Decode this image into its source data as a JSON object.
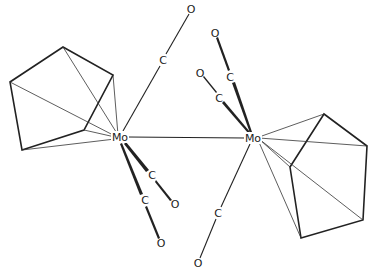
{
  "diagram": {
    "title": "",
    "molecule": "[CpMo(CO)3]2",
    "atoms": {
      "mo_left": {
        "label": "Mo",
        "x": 120,
        "y": 137
      },
      "mo_right": {
        "label": "Mo",
        "x": 253,
        "y": 138
      },
      "c_top_left": {
        "label": "C",
        "x": 163,
        "y": 60
      },
      "o_top_left": {
        "label": "O",
        "x": 191,
        "y": 9
      },
      "c_down1": {
        "label": "C",
        "x": 152,
        "y": 175
      },
      "o_down1": {
        "label": "O",
        "x": 175,
        "y": 204
      },
      "c_down2": {
        "label": "C",
        "x": 145,
        "y": 200
      },
      "o_down2": {
        "label": "O",
        "x": 161,
        "y": 243
      },
      "c_up1": {
        "label": "C",
        "x": 230,
        "y": 77
      },
      "o_up1": {
        "label": "O",
        "x": 215,
        "y": 33
      },
      "c_up2": {
        "label": "C",
        "x": 219,
        "y": 98
      },
      "o_up2": {
        "label": "O",
        "x": 200,
        "y": 73
      },
      "c_bottom_right": {
        "label": "C",
        "x": 218,
        "y": 213
      },
      "o_bottom_right": {
        "label": "O",
        "x": 198,
        "y": 263
      }
    },
    "cp_left": [
      [
        63,
        47
      ],
      [
        113,
        75
      ],
      [
        84,
        130
      ],
      [
        22,
        150
      ],
      [
        10,
        82
      ]
    ],
    "cp_right": [
      [
        324,
        114
      ],
      [
        367,
        146
      ],
      [
        363,
        220
      ],
      [
        301,
        238
      ],
      [
        290,
        167
      ]
    ]
  }
}
